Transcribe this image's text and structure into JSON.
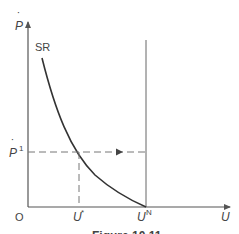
{
  "figure": {
    "type": "diagram",
    "labels": {
      "y_axis": "P",
      "y_axis_dot": "˙",
      "x_axis": "U",
      "origin": "O",
      "curve": "SR",
      "p1_base": "P",
      "p1_sup": "1",
      "u_star_base": "U",
      "u_star_sup": "*",
      "un_base": "U",
      "un_sup": "N",
      "caption": "Figure 10.11"
    },
    "colors": {
      "axis": "#555555",
      "curve": "#333333",
      "dashed": "#777777",
      "text": "#444444",
      "background": "#ffffff"
    }
  }
}
